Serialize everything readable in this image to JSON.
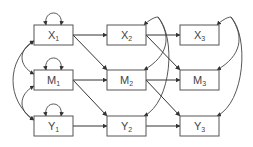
{
  "diagram": {
    "type": "cross-lagged panel model",
    "nodes": [
      {
        "id": "X1",
        "base": "X",
        "sub": "1",
        "x": 34,
        "y": 25
      },
      {
        "id": "X2",
        "base": "X",
        "sub": "2",
        "x": 107,
        "y": 25
      },
      {
        "id": "X3",
        "base": "X",
        "sub": "3",
        "x": 180,
        "y": 25
      },
      {
        "id": "M1",
        "base": "M",
        "sub": "1",
        "x": 34,
        "y": 70
      },
      {
        "id": "M2",
        "base": "M",
        "sub": "2",
        "x": 107,
        "y": 70
      },
      {
        "id": "M3",
        "base": "M",
        "sub": "3",
        "x": 180,
        "y": 70
      },
      {
        "id": "Y1",
        "base": "Y",
        "sub": "1",
        "x": 34,
        "y": 116
      },
      {
        "id": "Y2",
        "base": "Y",
        "sub": "2",
        "x": 107,
        "y": 116
      },
      {
        "id": "Y3",
        "base": "Y",
        "sub": "3",
        "x": 180,
        "y": 116
      }
    ],
    "box": {
      "width": 39,
      "height": 20
    },
    "directed_edges": [
      [
        "X1",
        "X2"
      ],
      [
        "X2",
        "X3"
      ],
      [
        "M1",
        "M2"
      ],
      [
        "M2",
        "M3"
      ],
      [
        "Y1",
        "Y2"
      ],
      [
        "Y2",
        "Y3"
      ],
      [
        "X1",
        "M2"
      ],
      [
        "X2",
        "M3"
      ],
      [
        "M1",
        "Y2"
      ],
      [
        "M2",
        "Y3"
      ]
    ],
    "self_loops": [
      "X1",
      "M1",
      "Y1"
    ],
    "covariances_left": [
      [
        "X1",
        "M1"
      ],
      [
        "M1",
        "Y1"
      ],
      [
        "X1",
        "Y1"
      ]
    ],
    "residual_covariances": [
      {
        "column": 2,
        "targets": [
          "X2",
          "M2",
          "Y2"
        ]
      },
      {
        "column": 3,
        "targets": [
          "X3",
          "M3",
          "Y3"
        ]
      }
    ],
    "colors": {
      "stroke": "#555555",
      "text": "#444444",
      "background": "#ffffff"
    }
  }
}
